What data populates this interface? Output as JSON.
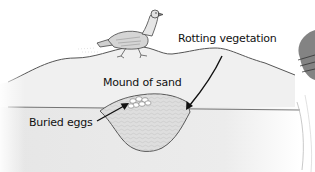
{
  "diagram": {
    "labels": {
      "rotting_vegetation": "Rotting vegetation",
      "mound_of_sand": "Mound of sand",
      "buried_eggs": "Buried eggs"
    },
    "elements": [
      "bird walking on mound",
      "mound of sand (surface curve)",
      "ground line",
      "pit filled with rotting vegetation",
      "cluster of buried eggs",
      "arrow to rotting vegetation",
      "arrow to buried eggs",
      "partial photo of bird at right edge (cropped)"
    ],
    "colors": {
      "background": "#ffffff",
      "ground_fill": "#e9e9e9",
      "mound_fill": "#efefef",
      "pit_fill": "#dcdcdc",
      "line": "#555555",
      "arrow": "#111111",
      "text": "#111111"
    }
  }
}
